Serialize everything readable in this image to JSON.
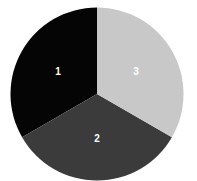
{
  "chart_data": {
    "type": "pie",
    "title": "",
    "categories": [
      "1",
      "2",
      "3"
    ],
    "values": [
      33.3,
      33.3,
      33.3
    ],
    "colors": [
      "#050505",
      "#3b3b3b",
      "#c8c8c8"
    ],
    "label_color": "#ffffff",
    "start_angle_deg": 0,
    "legend": false,
    "layout": {
      "cx": 97,
      "cy": 94,
      "r": 86.5
    }
  }
}
